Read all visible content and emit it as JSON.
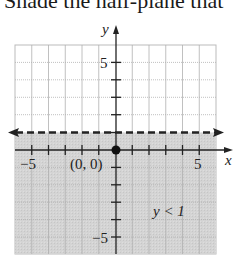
{
  "prompt": {
    "text": "Shade the half-plane that"
  },
  "graph": {
    "x_axis_label": "x",
    "y_axis_label": "y",
    "x_range": [
      -6,
      6
    ],
    "y_range": [
      -6,
      6
    ],
    "tick_labels": {
      "x_neg": "−5",
      "x_pos": "5",
      "y_pos": "5",
      "y_neg": "−5"
    },
    "test_point": {
      "label": "(0, 0)",
      "x": 0,
      "y": 0
    },
    "boundary_line": {
      "equation": "y = 1",
      "style": "dashed",
      "y": 1
    },
    "shaded_region_label": "y < 1",
    "colors": {
      "shade": "#d2d2d2",
      "grid": "#b5b5b5",
      "axis": "#222222",
      "boundary": "#222222"
    }
  }
}
